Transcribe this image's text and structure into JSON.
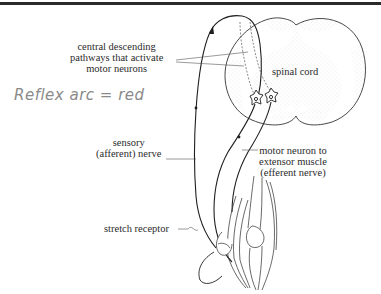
{
  "diagram": {
    "labels": {
      "central_pathways": [
        "central descending",
        "pathways that activate",
        "motor neurons"
      ],
      "spinal_cord": "spinal cord",
      "sensory_nerve": [
        "sensory",
        "(afferent) nerve"
      ],
      "motor_neuron": [
        "motor neuron to",
        "extensor muscle",
        "(efferent nerve)"
      ],
      "stretch_receptor": "stretch receptor"
    },
    "annotation": {
      "handwritten": "Reflex arc = red"
    },
    "colors": {
      "line": "#1f1f1f",
      "stipple": "#c8c8c8",
      "text": "#2b2b2b",
      "handwriting": "#8a8a8a",
      "top_rule": "#2a2a2a"
    }
  }
}
